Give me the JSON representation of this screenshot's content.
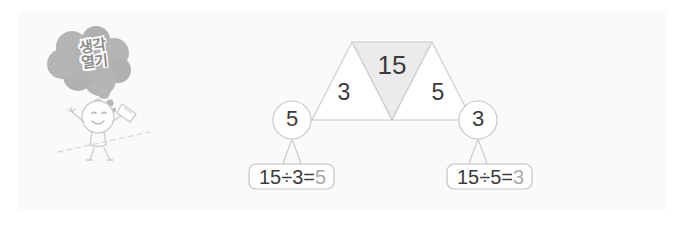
{
  "panel": {
    "background_color": "#fafafa"
  },
  "illustration": {
    "bubble": {
      "name": "thought-bubble",
      "text_line1": "생각",
      "text_line2": "열기",
      "fill_color": "#b3b3b3",
      "text_color": "#8d8d8d"
    },
    "character": {
      "name": "smiling-child-character",
      "line_color": "#c9c9c9"
    }
  },
  "diagram": {
    "type": "triangle-trapezoid-division-diagram",
    "shape_fill": "#ffffff",
    "highlight_fill": "#ebebeb",
    "stroke_color": "#c9c9c9",
    "triangles": [
      {
        "name": "left-triangle",
        "value": "3",
        "shaded": false
      },
      {
        "name": "middle-triangle",
        "value": "15",
        "shaded": true
      },
      {
        "name": "right-triangle",
        "value": "5",
        "shaded": false
      }
    ],
    "circles": [
      {
        "name": "left-circle",
        "value": "5"
      },
      {
        "name": "right-circle",
        "value": "3"
      }
    ]
  },
  "equations": [
    {
      "name": "left-equation",
      "dividend": "15",
      "divisor": "3",
      "quotient": "5",
      "expression": "15÷3=",
      "answer": "5",
      "answer_color": "#a8a8a8"
    },
    {
      "name": "right-equation",
      "dividend": "15",
      "divisor": "5",
      "quotient": "3",
      "expression": "15÷5=",
      "answer": "3",
      "answer_color": "#a8a8a8"
    }
  ]
}
